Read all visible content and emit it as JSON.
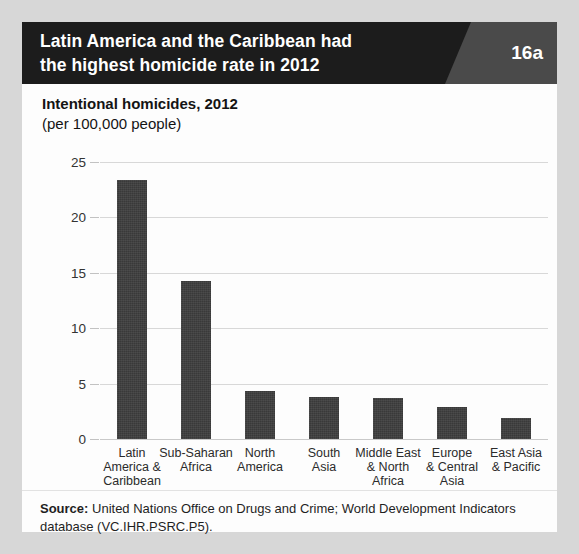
{
  "header": {
    "title_line1": "Latin America and the Caribbean had",
    "title_line2": "the highest homicide rate in 2012",
    "badge": "16a",
    "bar_color": "#1c1c1c",
    "badge_color": "#4a4a4a"
  },
  "chart": {
    "title": "Intentional homicides, 2012",
    "subtitle": "(per 100,000 people)"
  },
  "footer": {
    "source_label": "Source:",
    "source_text": " United Nations Office on Drugs and Crime; World Development Indicators database (VC.IHR.PSRC.P5)."
  },
  "chart_data": {
    "type": "bar",
    "title": "Intentional homicides, 2012",
    "subtitle": "(per 100,000 people)",
    "xlabel": "",
    "ylabel": "",
    "ylim": [
      0,
      25
    ],
    "yticks": [
      0,
      5,
      10,
      15,
      20,
      25
    ],
    "ytick_labels": [
      "0",
      "5",
      "10",
      "15",
      "20",
      "25"
    ],
    "grid": true,
    "legend": false,
    "bar_color": "#3c3c3c",
    "categories": [
      "Latin America & Caribbean",
      "Sub-Saharan Africa",
      "North America",
      "South Asia",
      "Middle East & North Africa",
      "Europe & Central Asia",
      "East Asia & Pacific"
    ],
    "category_lines": [
      [
        "Latin",
        "America &",
        "Caribbean"
      ],
      [
        "Sub-Saharan",
        "Africa"
      ],
      [
        "North",
        "America"
      ],
      [
        "South",
        "Asia"
      ],
      [
        "Middle East",
        "& North",
        "Africa"
      ],
      [
        "Europe",
        "& Central",
        "Asia"
      ],
      [
        "East Asia",
        "& Pacific"
      ]
    ],
    "values": [
      23.4,
      14.3,
      4.3,
      3.8,
      3.7,
      2.9,
      1.9
    ]
  }
}
